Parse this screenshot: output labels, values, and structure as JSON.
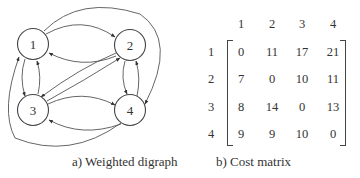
{
  "figure_a": {
    "caption": "a) Weighted digraph",
    "nodes": [
      {
        "id": "1",
        "label": "1",
        "cx": 33,
        "cy": 44
      },
      {
        "id": "2",
        "label": "2",
        "cx": 130,
        "cy": 45
      },
      {
        "id": "3",
        "label": "3",
        "cx": 33,
        "cy": 110
      },
      {
        "id": "4",
        "label": "4",
        "cx": 130,
        "cy": 110
      }
    ],
    "edges": [
      {
        "from": "1",
        "to": "2"
      },
      {
        "from": "2",
        "to": "1"
      },
      {
        "from": "1",
        "to": "3"
      },
      {
        "from": "3",
        "to": "1"
      },
      {
        "from": "1",
        "to": "4"
      },
      {
        "from": "4",
        "to": "1"
      },
      {
        "from": "2",
        "to": "3"
      },
      {
        "from": "3",
        "to": "2"
      },
      {
        "from": "2",
        "to": "4"
      },
      {
        "from": "4",
        "to": "2"
      },
      {
        "from": "3",
        "to": "4"
      },
      {
        "from": "4",
        "to": "3"
      }
    ]
  },
  "figure_b": {
    "caption": "b) Cost matrix",
    "column_headers": [
      "1",
      "2",
      "3",
      "4"
    ],
    "row_headers": [
      "1",
      "2",
      "3",
      "4"
    ],
    "rows": [
      [
        "0",
        "11",
        "17",
        "21"
      ],
      [
        "7",
        "0",
        "10",
        "11"
      ],
      [
        "8",
        "14",
        "0",
        "13"
      ],
      [
        "9",
        "9",
        "10",
        "0"
      ]
    ]
  }
}
